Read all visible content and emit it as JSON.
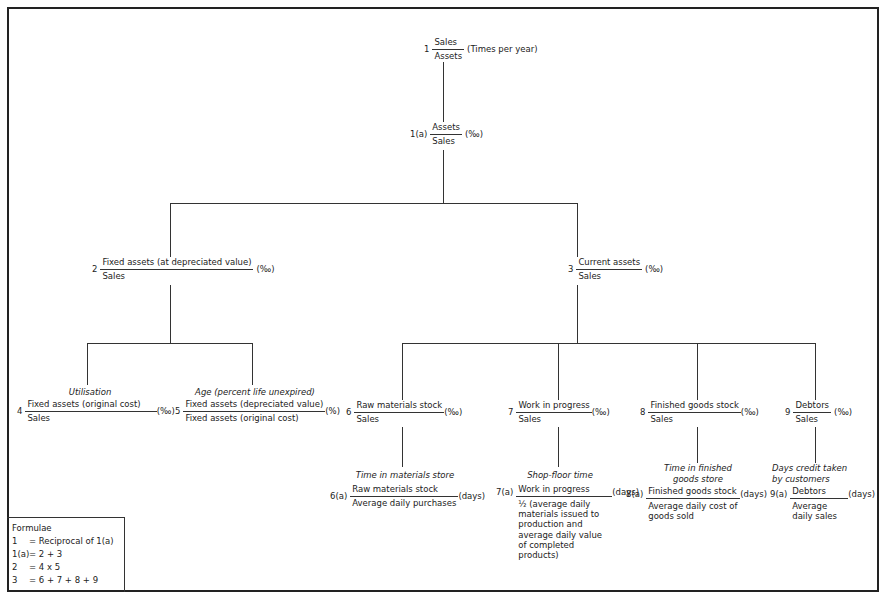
{
  "nodes": {
    "n1": {
      "index": "1",
      "numerator": "Sales",
      "denominator": "Assets",
      "unit": "(Times per year)"
    },
    "n1a": {
      "index": "1(a)",
      "numerator": "Assets",
      "denominator": "Sales",
      "unit": "(‰)"
    },
    "n2": {
      "index": "2",
      "numerator": "Fixed assets (at depreciated value)",
      "denominator": "Sales",
      "unit": "(‰)"
    },
    "n3": {
      "index": "3",
      "numerator": "Current assets",
      "denominator": "Sales",
      "unit": "(‰)"
    },
    "n4": {
      "caption": "Utilisation",
      "index": "4",
      "numerator": "Fixed assets (original cost)",
      "denominator": "Sales",
      "unit": "(‰)"
    },
    "n5": {
      "caption": "Age (percent life unexpired)",
      "index": "5",
      "numerator": "Fixed assets (depreciated value)",
      "denominator": "Fixed assets (original cost)",
      "unit": "(%)"
    },
    "n6": {
      "index": "6",
      "numerator": "Raw materials stock",
      "denominator": "Sales",
      "unit": "(‰)"
    },
    "n7": {
      "index": "7",
      "numerator": "Work in progress",
      "denominator": "Sales",
      "unit": "(‰)"
    },
    "n8": {
      "index": "8",
      "numerator": "Finished goods stock",
      "denominator": "Sales",
      "unit": "(‰)"
    },
    "n9": {
      "index": "9",
      "numerator": "Debtors",
      "denominator": "Sales",
      "unit": "(‰)"
    },
    "n6a": {
      "caption": "Time in materials store",
      "index": "6(a)",
      "numerator": "Raw materials stock",
      "denominator": "Average daily purchases",
      "unit": "(days)"
    },
    "n7a": {
      "caption": "Shop-floor time",
      "index": "7(a)",
      "numerator": "Work in progress",
      "denominator": "½ (average daily materials issued to production and average daily value of completed products)",
      "unit": "(days)"
    },
    "n8a": {
      "caption": "Time in finished goods store",
      "index": "8(a)",
      "numerator": "Finished goods stock",
      "denominator": "Average daily cost of goods sold",
      "unit": "(days)"
    },
    "n9a": {
      "caption": "Days credit taken by customers",
      "index": "9(a)",
      "numerator": "Debtors",
      "denominator": "Average daily sales",
      "unit": "(days)"
    }
  },
  "formulae": {
    "title": "Formulae",
    "rows": [
      {
        "key": "1",
        "value": "= Reciprocal of 1(a)"
      },
      {
        "key": "1(a)",
        "value": "= 2 + 3"
      },
      {
        "key": "2",
        "value": "= 4 x 5"
      },
      {
        "key": "3",
        "value": "= 6 + 7 + 8 + 9"
      }
    ]
  }
}
